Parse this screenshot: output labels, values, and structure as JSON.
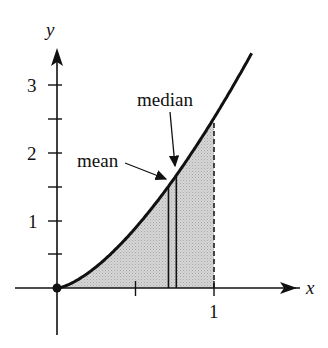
{
  "chart_data": {
    "type": "area",
    "title": "",
    "xlabel": "x",
    "ylabel": "y",
    "function": "y = 2.5 x^(3/2)",
    "shaded_interval": [
      0,
      1
    ],
    "x_ticks": [
      {
        "value": 0.5,
        "label": ""
      },
      {
        "value": 1,
        "label": "1"
      }
    ],
    "y_ticks": [
      {
        "value": 0.5,
        "label": ""
      },
      {
        "value": 1,
        "label": "1"
      },
      {
        "value": 1.5,
        "label": ""
      },
      {
        "value": 2,
        "label": "2"
      },
      {
        "value": 2.5,
        "label": ""
      },
      {
        "value": 3,
        "label": "3"
      }
    ],
    "xlim": [
      -0.3,
      1.6
    ],
    "ylim": [
      -0.7,
      3.7
    ],
    "points": [
      {
        "x": 0,
        "y": 0,
        "label": "origin-dot"
      }
    ],
    "vertical_lines": [
      {
        "name": "mean",
        "x": 0.71,
        "style": "solid"
      },
      {
        "name": "median",
        "x": 0.76,
        "style": "solid"
      },
      {
        "name": "right-bound",
        "x": 1,
        "style": "dashed"
      }
    ],
    "annotations": [
      {
        "text": "mean",
        "points_to_x": 0.71
      },
      {
        "text": "median",
        "points_to_x": 0.76
      }
    ],
    "grid": false,
    "legend": null
  },
  "labels": {
    "x_axis": "x",
    "y_axis": "y",
    "x_tick_1": "1",
    "y_tick_1": "1",
    "y_tick_2": "2",
    "y_tick_3": "3",
    "mean": "mean",
    "median": "median"
  },
  "colors": {
    "ink": "#111111",
    "shade": "#cfcfcf"
  }
}
